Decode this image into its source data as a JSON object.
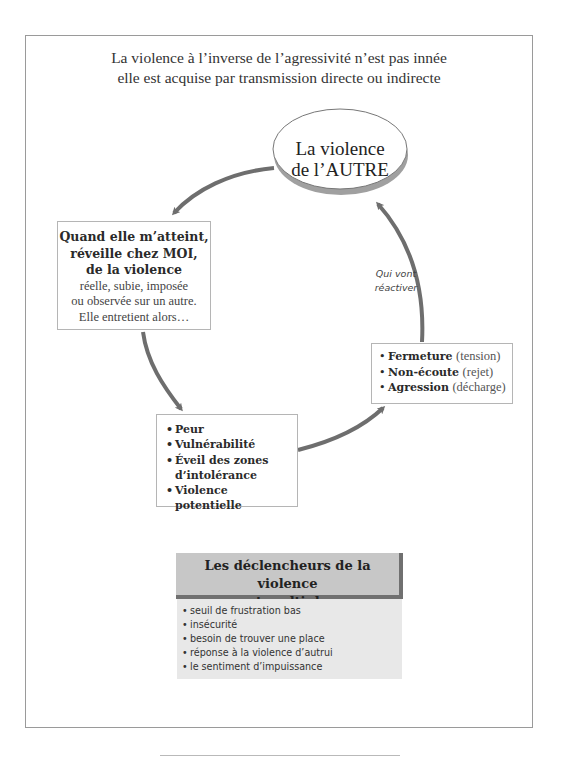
{
  "intro": {
    "line1": "La violence à l’inverse de l’agressivité n’est pas innée",
    "line2": "elle est acquise par transmission directe ou indirecte"
  },
  "ellipse": {
    "line1": "La violence",
    "line2": "de l’AUTRE"
  },
  "left_box": {
    "bold_lines": [
      "Quand elle m’atteint,",
      "réveille chez MOI,",
      "de la violence"
    ],
    "normal_lines": [
      "réelle, subie, imposée",
      "ou observée sur un autre.",
      "Elle entretient alors…"
    ]
  },
  "arrow_label": {
    "line1": "Qui vont",
    "line2": "réactiver"
  },
  "right_box": {
    "items": [
      {
        "bold": "Fermeture",
        "normal": "(tension)"
      },
      {
        "bold": "Non-écoute",
        "normal": "(rejet)"
      },
      {
        "bold": "Agression",
        "normal": "(décharge)"
      }
    ]
  },
  "bottom_box": {
    "items": [
      "Peur",
      "Vulnérabilité",
      "Éveil des zones d’intolérance",
      "Violence potentielle"
    ]
  },
  "triggers": {
    "title_line1": "Les déclencheurs de la violence",
    "title_line2": "sont multiples :",
    "items": [
      "seuil de frustration bas",
      "insécurité",
      "besoin de trouver une place",
      "réponse à la violence d’autrui",
      "le sentiment d’impuissance"
    ]
  },
  "colors": {
    "arrow": "#6e6e6e",
    "frame_border": "#9a9a9a",
    "trigger_header_bg": "#c7c7c7",
    "trigger_header_shadow": "#707070",
    "trigger_body_bg": "#e8e8e8"
  }
}
